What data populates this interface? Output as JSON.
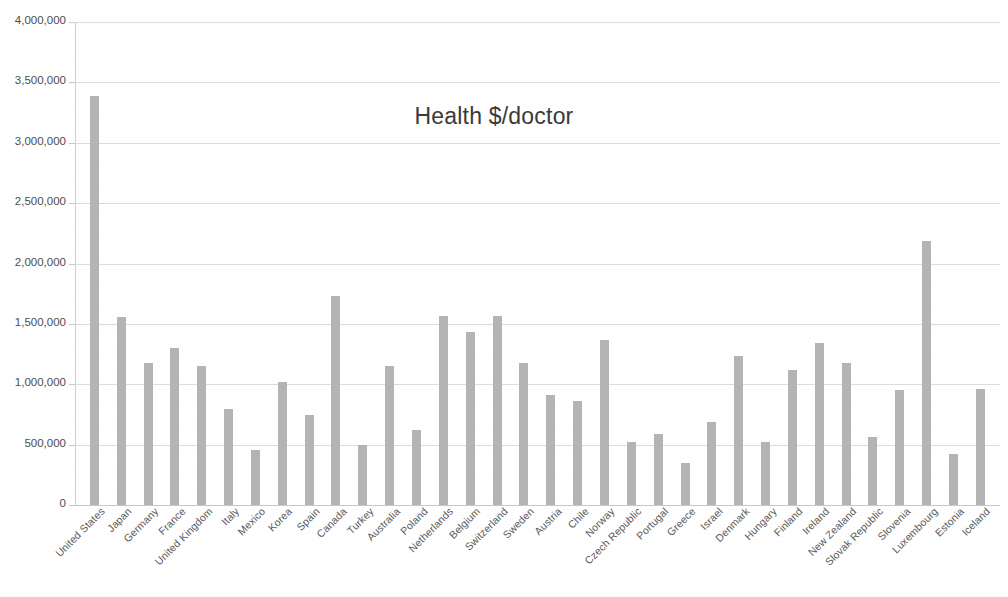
{
  "chart_data": {
    "type": "bar",
    "title": "Health $/doctor",
    "xlabel": "",
    "ylabel": "",
    "ylim": [
      0,
      4000000
    ],
    "ytick_step": 500000,
    "ytick_labels": [
      "4,000,000",
      "3,500,000",
      "3,000,000",
      "2,500,000",
      "2,000,000",
      "1,500,000",
      "1,000,000",
      "500,000",
      "0"
    ],
    "ytick_values": [
      4000000,
      3500000,
      3000000,
      2500000,
      2000000,
      1500000,
      1000000,
      500000,
      0
    ],
    "grid": true,
    "legend": "none",
    "bar_color": "#b4b4b4",
    "categories": [
      "United States",
      "Japan",
      "Germany",
      "France",
      "United Kingdom",
      "Italy",
      "Mexico",
      "Korea",
      "Spain",
      "Canada",
      "Turkey",
      "Australia",
      "Poland",
      "Netherlands",
      "Belgium",
      "Switzerland",
      "Sweden",
      "Austria",
      "Chile",
      "Norway",
      "Czech Republic",
      "Portugal",
      "Greece",
      "Israel",
      "Denmark",
      "Hungary",
      "Finland",
      "Ireland",
      "New Zealand",
      "Slovak Republic",
      "Slovenia",
      "Luxembourg",
      "Estonia",
      "Iceland"
    ],
    "values": [
      3390000,
      1560000,
      1175000,
      1300000,
      1150000,
      795000,
      455000,
      1015000,
      745000,
      1735000,
      495000,
      1155000,
      625000,
      1565000,
      1435000,
      1565000,
      1175000,
      915000,
      860000,
      1370000,
      520000,
      590000,
      345000,
      690000,
      1235000,
      520000,
      1120000,
      1340000,
      1175000,
      560000,
      955000,
      2190000,
      420000,
      960000
    ]
  }
}
